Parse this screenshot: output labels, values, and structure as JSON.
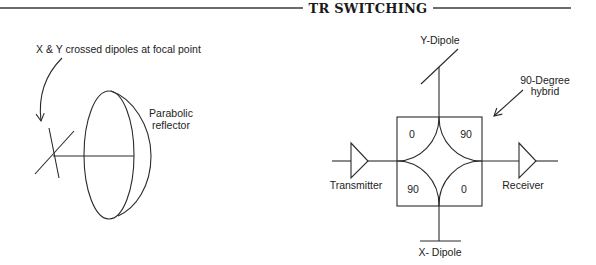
{
  "header": {
    "title": "TR SWITCHING"
  },
  "left_diagram": {
    "caption": "X & Y crossed dipoles at focal point",
    "reflector_label_line1": "Parabolic",
    "reflector_label_line2": "reflector"
  },
  "right_diagram": {
    "y_dipole_label": "Y-Dipole",
    "x_dipole_label": "X- Dipole",
    "hybrid_label_line1": "90-Degree",
    "hybrid_label_line2": "hybrid",
    "transmitter_label": "Transmitter",
    "receiver_label": "Receiver",
    "ports": {
      "top_left": "0",
      "top_right": "90",
      "bottom_left": "90",
      "bottom_right": "0"
    }
  },
  "colors": {
    "line": "#2a2a2a",
    "background": "#ffffff"
  }
}
